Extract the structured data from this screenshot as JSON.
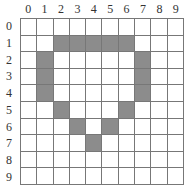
{
  "grid": {
    "rows": 10,
    "cols": 10,
    "col_labels": [
      "0",
      "1",
      "2",
      "3",
      "4",
      "5",
      "6",
      "7",
      "8",
      "9"
    ],
    "row_labels": [
      "0",
      "1",
      "2",
      "3",
      "4",
      "5",
      "6",
      "7",
      "8",
      "9"
    ],
    "fill_color": "#8c8c8c",
    "empty_color": "#ffffff",
    "line_color": "#777777",
    "filled_cells": [
      [
        1,
        2
      ],
      [
        1,
        3
      ],
      [
        1,
        4
      ],
      [
        1,
        5
      ],
      [
        1,
        6
      ],
      [
        2,
        1
      ],
      [
        2,
        7
      ],
      [
        3,
        1
      ],
      [
        3,
        7
      ],
      [
        4,
        1
      ],
      [
        4,
        7
      ],
      [
        5,
        2
      ],
      [
        5,
        6
      ],
      [
        6,
        3
      ],
      [
        6,
        5
      ],
      [
        7,
        4
      ]
    ]
  }
}
